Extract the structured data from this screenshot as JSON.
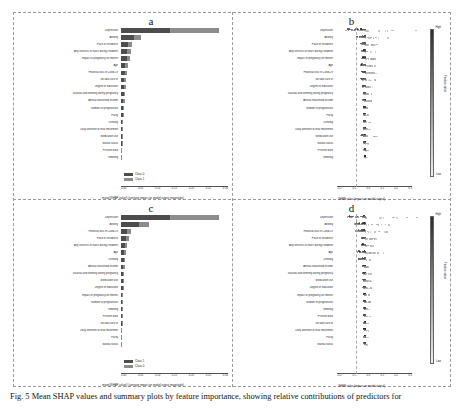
{
  "figure": {
    "caption_prefix": "Fig. 5",
    "caption": "Fig. 5   Mean SHAP values and summary plots by feature importance, showing relative contributions of predictors for"
  },
  "panels": [
    {
      "id": "a",
      "label": "a",
      "type": "bar",
      "xlabel": "mean(|SHAP value|) (average impact on model output magnitude)",
      "xticks": [
        "0.00",
        "0.05",
        "0.10",
        "0.15",
        "0.20",
        "0.25",
        "0.30"
      ],
      "xlim": [
        0,
        0.32
      ],
      "legend": [
        "Class 0",
        "Class 1"
      ],
      "features": [
        "Depression",
        "Anxiety",
        "Place of residence",
        "Any services or hours during childbirth",
        "Impact of pregnancy on mother",
        "Age",
        "Financial loss in Covid-19",
        "No take care of",
        "Degree of education",
        "Nausea and vomiting during pregnancy",
        "Annual household income",
        "Number of pregnancies",
        "Parity",
        "Drinking",
        "Daily attention to fetal movement",
        "Medication use",
        "Marital status",
        "Present work",
        "Smoking"
      ],
      "values_class0": [
        0.15,
        0.04,
        0.021,
        0.019,
        0.018,
        0.013,
        0.012,
        0.01,
        0.009,
        0.008,
        0.007,
        0.006,
        0.005,
        0.004,
        0.004,
        0.003,
        0.002,
        0.001,
        0.0
      ],
      "values_class1": [
        0.15,
        0.022,
        0.013,
        0.012,
        0.011,
        0.008,
        0.007,
        0.006,
        0.005,
        0.005,
        0.004,
        0.004,
        0.003,
        0.003,
        0.002,
        0.002,
        0.001,
        0.001,
        0.0
      ]
    },
    {
      "id": "b",
      "label": "b",
      "type": "beeswarm",
      "xlabel": "SHAP value (impact on model output)",
      "xticks": [
        "-0.2",
        "-0.1",
        "0.0",
        "0.1",
        "0.2",
        "0.3"
      ],
      "xlim": [
        -0.25,
        0.35
      ],
      "colorbar": {
        "title": "Feature value",
        "high": "High",
        "low": "Low"
      },
      "features": [
        "Depression",
        "Anxiety",
        "Place of residence",
        "Any services or hours during childbirth",
        "Impact of pregnancy on mother",
        "Age",
        "Financial loss in Covid-19",
        "No take care of",
        "Degree of education",
        "Nausea and vomiting during pregnancy",
        "Annual household income",
        "Number of pregnancies",
        "Parity",
        "Drinking",
        "Daily attention to fetal movement",
        "Medication use",
        "Marital status",
        "Present work",
        "Smoking"
      ],
      "spreads": [
        0.9,
        0.42,
        0.2,
        0.17,
        0.16,
        0.22,
        0.18,
        0.19,
        0.12,
        0.1,
        0.1,
        0.09,
        0.08,
        0.08,
        0.08,
        0.22,
        0.06,
        0.05,
        0.04
      ]
    },
    {
      "id": "c",
      "label": "c",
      "type": "bar",
      "xlabel": "mean(|SHAP value|) (average impact on model output magnitude)",
      "xticks": [
        "0.00",
        "0.05",
        "0.10",
        "0.15",
        "0.20",
        "0.25",
        "0.30"
      ],
      "xlim": [
        0,
        0.32
      ],
      "legend": [
        "Class 1",
        "Class 0"
      ],
      "features": [
        "Depression",
        "Anxiety",
        "Financial loss in Covid-19",
        "Place of residence",
        "Any services or hours during childbirth",
        "Age",
        "Drinking",
        "Annual household income",
        "Nausea and vomiting during pregnancy",
        "Medication use",
        "Degree of education",
        "Impact of pregnancy on mother",
        "Number of pregnancies",
        "Smoking",
        "Present work",
        "No take care of",
        "Daily attention to fetal movement",
        "Parity",
        "Marital status"
      ],
      "values_class0": [
        0.15,
        0.055,
        0.019,
        0.016,
        0.012,
        0.009,
        0.008,
        0.007,
        0.006,
        0.005,
        0.005,
        0.004,
        0.003,
        0.003,
        0.002,
        0.002,
        0.001,
        0.001,
        0.0
      ],
      "values_class1": [
        0.15,
        0.03,
        0.011,
        0.01,
        0.007,
        0.005,
        0.005,
        0.004,
        0.004,
        0.003,
        0.003,
        0.002,
        0.002,
        0.002,
        0.001,
        0.001,
        0.001,
        0.0,
        0.0
      ]
    },
    {
      "id": "d",
      "label": "d",
      "type": "beeswarm",
      "xlabel": "SHAP value (impact on model output)",
      "xticks": [
        "-0.2",
        "-0.1",
        "0.0",
        "0.1",
        "0.2",
        "0.3"
      ],
      "xlim": [
        -0.25,
        0.35
      ],
      "colorbar": {
        "title": "Feature value",
        "high": "High",
        "low": "Low"
      },
      "features": [
        "Depression",
        "Anxiety",
        "Financial loss in Covid-19",
        "Place of residence",
        "Any services or hours during childbirth",
        "Age",
        "Drinking",
        "Annual household income",
        "Nausea and vomiting during pregnancy",
        "Medication use",
        "Degree of education",
        "Impact of pregnancy on mother",
        "Number of pregnancies",
        "Smoking",
        "Present work",
        "No take care of",
        "Daily attention to fetal movement",
        "Parity",
        "Marital status"
      ],
      "spreads": [
        0.85,
        0.5,
        0.45,
        0.18,
        0.15,
        0.35,
        0.3,
        0.12,
        0.12,
        0.1,
        0.1,
        0.09,
        0.09,
        0.08,
        0.08,
        0.07,
        0.07,
        0.06,
        0.05
      ]
    }
  ]
}
